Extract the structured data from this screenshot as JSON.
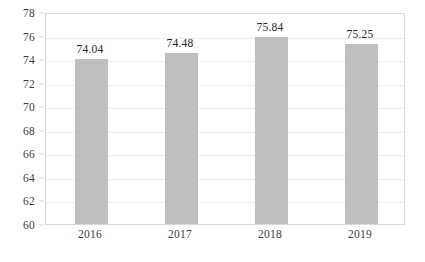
{
  "chart_data": {
    "type": "bar",
    "title": "",
    "subtitle": "",
    "xlabel": "",
    "ylabel": "",
    "categories": [
      "2016",
      "2017",
      "2018",
      "2019"
    ],
    "values": [
      74.04,
      74.48,
      75.84,
      75.25
    ],
    "data_labels": [
      "74.04",
      "74.48",
      "75.84",
      "75.25"
    ],
    "ylim": [
      60,
      78
    ],
    "ytick_step": 2,
    "ytick_labels": [
      "78",
      "76",
      "74",
      "72",
      "70",
      "68",
      "66",
      "64",
      "62",
      "60"
    ],
    "ytick_values": [
      78,
      76,
      74,
      72,
      70,
      68,
      66,
      64,
      62,
      60
    ],
    "grid": "horizontal",
    "legend": "none",
    "series": [
      {
        "name": "",
        "values": [
          74.04,
          74.48,
          75.84,
          75.25
        ],
        "color": "#BFBFBF"
      }
    ],
    "colors": {
      "bar": "#BFBFBF",
      "gridline": "#EDEDED",
      "plot_border": "#D9D9D9",
      "tick_text": "#3B3B3B",
      "label_text": "#262626",
      "background": "#FFFFFF"
    }
  }
}
